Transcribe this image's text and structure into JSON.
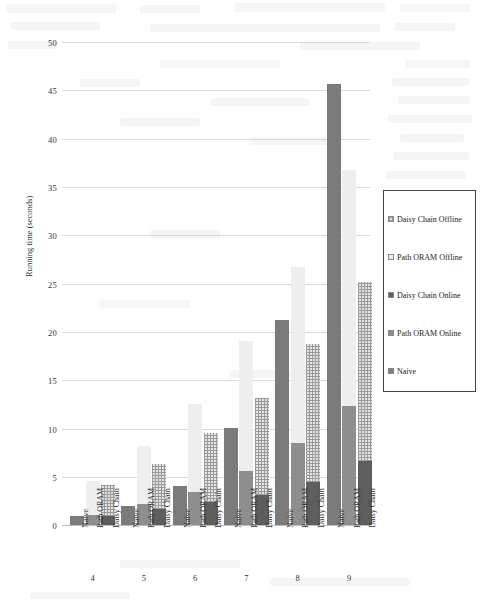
{
  "chart_data": {
    "type": "bar",
    "title": "",
    "xlabel": "",
    "ylabel": "Running time (seconds)",
    "ylim": [
      0,
      50
    ],
    "yticks": [
      0,
      5,
      10,
      15,
      20,
      25,
      30,
      35,
      40,
      45,
      50
    ],
    "grid": true,
    "stacked": true,
    "legend_position": "right",
    "group_labels": [
      "4",
      "5",
      "6",
      "7",
      "8",
      "9"
    ],
    "bar_labels": [
      "Naive",
      "Path ORAM",
      "Daisy Chain"
    ],
    "series": [
      {
        "name": "Naive",
        "color": "#7b7b7b",
        "bar": "Naive",
        "values": [
          0.9,
          2.0,
          4.0,
          10.0,
          21.2,
          45.7
        ]
      },
      {
        "name": "Path ORAM Online",
        "color": "#8e8e8e",
        "bar": "Path ORAM",
        "values": [
          1.0,
          2.2,
          3.4,
          5.6,
          8.5,
          12.3
        ]
      },
      {
        "name": "Path ORAM Offline",
        "color": "#eeeeee",
        "bar": "Path ORAM",
        "values": [
          3.6,
          6.0,
          9.1,
          13.4,
          18.2,
          24.4
        ]
      },
      {
        "name": "Daisy Chain Online",
        "color": "#5e5e5e",
        "bar": "Daisy Chain",
        "values": [
          0.9,
          1.7,
          2.4,
          3.1,
          4.5,
          6.6
        ]
      },
      {
        "name": "Daisy Chain Offline",
        "color": "#e4e4e4",
        "bar": "Daisy Chain",
        "values": [
          3.2,
          4.6,
          7.1,
          10.1,
          14.2,
          18.6
        ]
      }
    ],
    "bar_totals": {
      "Naive": [
        0.9,
        2.0,
        4.0,
        10.0,
        21.2,
        45.7
      ],
      "Path ORAM": [
        4.6,
        8.2,
        12.5,
        19.0,
        26.7,
        36.7
      ],
      "Daisy Chain": [
        4.1,
        6.3,
        9.5,
        13.2,
        18.7,
        25.2
      ]
    },
    "legend_entries": [
      {
        "label": "Daisy Chain Offline",
        "style": "daisy-offline"
      },
      {
        "label": "Path ORAM Offline",
        "style": "path-offline"
      },
      {
        "label": "Daisy Chain Online",
        "style": "daisy-online"
      },
      {
        "label": "Path ORAM Online",
        "style": "path-online"
      },
      {
        "label": "Naive",
        "style": "naive"
      }
    ]
  },
  "axis": {
    "y_label": "Running time (seconds)",
    "y_ticks": [
      "50",
      "45",
      "40",
      "35",
      "30",
      "25",
      "20",
      "15",
      "10",
      "5",
      "0"
    ]
  }
}
